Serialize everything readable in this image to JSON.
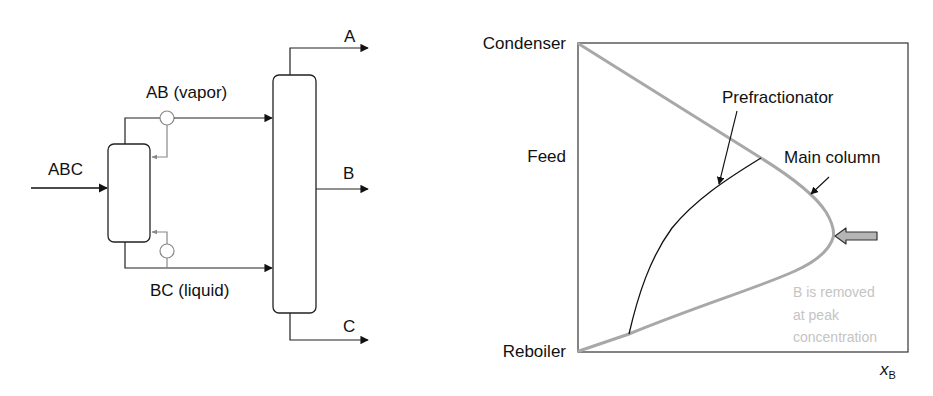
{
  "flowsheet": {
    "feed_label": "ABC",
    "vapor_label": "AB (vapor)",
    "liquid_label": "BC (liquid)",
    "outlet_top_label": "A",
    "outlet_side_label": "B",
    "outlet_bottom_label": "C"
  },
  "profile": {
    "y_labels": {
      "top": "Condenser",
      "middle": "Feed",
      "bottom": "Reboiler"
    },
    "x_label_main": "x",
    "x_label_sub": "B",
    "annotations": {
      "prefractionator": "Prefractionator",
      "main_column": "Main column",
      "note_line1": "B is removed",
      "note_line2": "at peak",
      "note_line3": "concentration"
    },
    "colors": {
      "main_curve": "#a8a8a8",
      "prefractionator_curve": "#111111",
      "note_text": "#c4c4c4",
      "fat_arrow_fill": "#b5b5b5"
    }
  }
}
